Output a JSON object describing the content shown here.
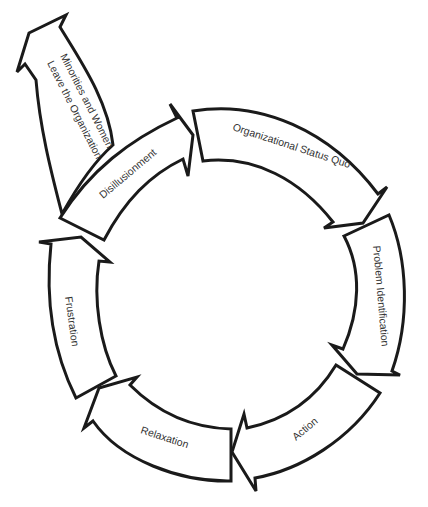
{
  "diagram": {
    "type": "cycle",
    "stages": [
      {
        "id": "status-quo",
        "label": "Organizational Status Quo"
      },
      {
        "id": "problem-identification",
        "label": "Problem Identification"
      },
      {
        "id": "action",
        "label": "Action"
      },
      {
        "id": "relaxation",
        "label": "Relaxation"
      },
      {
        "id": "frustration",
        "label": "Frustration"
      },
      {
        "id": "disillusionment",
        "label": "Disillusionment"
      }
    ],
    "exit": {
      "label_line1": "Minorities and Women",
      "label_line2": "Leave the Organization",
      "from": "disillusionment"
    },
    "colors": {
      "stroke": "#1a1a1a",
      "fill": "#ffffff",
      "text": "#333333"
    }
  }
}
